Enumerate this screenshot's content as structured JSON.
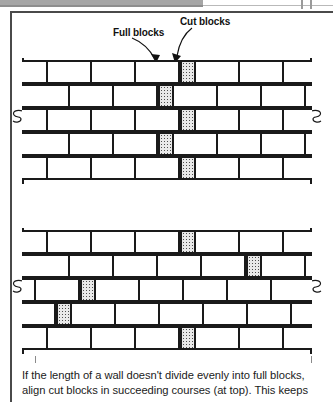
{
  "figure": {
    "title_labels": {
      "full_blocks": "Full blocks",
      "cut_blocks": "Cut blocks"
    },
    "caption_lines": [
      "If the length of a wall doesn't divide evenly into full blocks,",
      "align cut blocks in succeeding courses (at top). This keeps"
    ],
    "colors": {
      "ink": "#1a1a1a",
      "cut_block_fill": "#e9e9e9",
      "page_background": "#ffffff",
      "scan_bar": "#a6a6a6",
      "frame_rule": "#4a4a4a"
    },
    "icons": {
      "leader_arrow": "arrow-icon",
      "break_symbol": "wall-break-squiggle-icon"
    }
  },
  "walls": [
    {
      "name": "aligned-cut-blocks-wall",
      "description": "Top wall: cut blocks aligned vertically in succeeding courses",
      "courses": [
        {
          "blocks": [
            {
              "w": 26,
              "cut": false
            },
            {
              "w": 44,
              "cut": false
            },
            {
              "w": 44,
              "cut": false
            },
            {
              "w": 44,
              "cut": false
            },
            {
              "w": 16,
              "cut": true
            },
            {
              "w": 44,
              "cut": false
            },
            {
              "w": 44,
              "cut": false
            },
            {
              "w": 28,
              "cut": false
            }
          ]
        },
        {
          "blocks": [
            {
              "w": 48,
              "cut": false
            },
            {
              "w": 44,
              "cut": false
            },
            {
              "w": 44,
              "cut": false
            },
            {
              "w": 16,
              "cut": true
            },
            {
              "w": 44,
              "cut": false
            },
            {
              "w": 44,
              "cut": false
            },
            {
              "w": 44,
              "cut": false
            },
            {
              "w": 6,
              "cut": false
            }
          ]
        },
        {
          "blocks": [
            {
              "w": 26,
              "cut": false
            },
            {
              "w": 44,
              "cut": false
            },
            {
              "w": 44,
              "cut": false
            },
            {
              "w": 44,
              "cut": false
            },
            {
              "w": 16,
              "cut": true
            },
            {
              "w": 44,
              "cut": false
            },
            {
              "w": 44,
              "cut": false
            },
            {
              "w": 28,
              "cut": false
            }
          ]
        },
        {
          "blocks": [
            {
              "w": 48,
              "cut": false
            },
            {
              "w": 44,
              "cut": false
            },
            {
              "w": 44,
              "cut": false
            },
            {
              "w": 16,
              "cut": true
            },
            {
              "w": 44,
              "cut": false
            },
            {
              "w": 44,
              "cut": false
            },
            {
              "w": 44,
              "cut": false
            },
            {
              "w": 6,
              "cut": false
            }
          ]
        },
        {
          "blocks": [
            {
              "w": 26,
              "cut": false
            },
            {
              "w": 44,
              "cut": false
            },
            {
              "w": 44,
              "cut": false
            },
            {
              "w": 44,
              "cut": false
            },
            {
              "w": 16,
              "cut": true
            },
            {
              "w": 44,
              "cut": false
            },
            {
              "w": 44,
              "cut": false
            },
            {
              "w": 28,
              "cut": false
            }
          ]
        }
      ]
    },
    {
      "name": "staggered-cut-blocks-wall",
      "description": "Bottom wall: cut blocks scattered at different positions in each course",
      "courses": [
        {
          "blocks": [
            {
              "w": 26,
              "cut": false
            },
            {
              "w": 44,
              "cut": false
            },
            {
              "w": 44,
              "cut": false
            },
            {
              "w": 44,
              "cut": false
            },
            {
              "w": 16,
              "cut": true
            },
            {
              "w": 44,
              "cut": false
            },
            {
              "w": 44,
              "cut": false
            },
            {
              "w": 28,
              "cut": false
            }
          ]
        },
        {
          "blocks": [
            {
              "w": 48,
              "cut": false
            },
            {
              "w": 44,
              "cut": false
            },
            {
              "w": 44,
              "cut": false
            },
            {
              "w": 44,
              "cut": false
            },
            {
              "w": 44,
              "cut": false
            },
            {
              "w": 16,
              "cut": true
            },
            {
              "w": 44,
              "cut": false
            },
            {
              "w": 6,
              "cut": false
            }
          ]
        },
        {
          "blocks": [
            {
              "w": 14,
              "cut": false
            },
            {
              "w": 44,
              "cut": false
            },
            {
              "w": 16,
              "cut": true
            },
            {
              "w": 44,
              "cut": false
            },
            {
              "w": 44,
              "cut": false
            },
            {
              "w": 44,
              "cut": false
            },
            {
              "w": 44,
              "cut": false
            },
            {
              "w": 40,
              "cut": false
            }
          ]
        },
        {
          "blocks": [
            {
              "w": 34,
              "cut": false
            },
            {
              "w": 16,
              "cut": true
            },
            {
              "w": 44,
              "cut": false
            },
            {
              "w": 44,
              "cut": false
            },
            {
              "w": 44,
              "cut": false
            },
            {
              "w": 44,
              "cut": false
            },
            {
              "w": 44,
              "cut": false
            },
            {
              "w": 20,
              "cut": false
            }
          ]
        },
        {
          "blocks": [
            {
              "w": 26,
              "cut": false
            },
            {
              "w": 44,
              "cut": false
            },
            {
              "w": 44,
              "cut": false
            },
            {
              "w": 44,
              "cut": false
            },
            {
              "w": 16,
              "cut": true
            },
            {
              "w": 44,
              "cut": false
            },
            {
              "w": 44,
              "cut": false
            },
            {
              "w": 28,
              "cut": false
            }
          ]
        }
      ]
    }
  ]
}
